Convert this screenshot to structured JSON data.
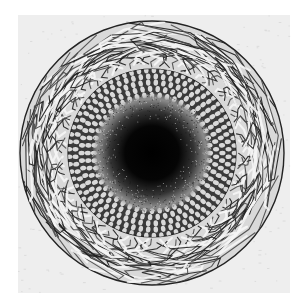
{
  "image": {
    "subject": "circular engraving: flame-ringed disc with cellular middle band and dark stippled core",
    "style": "monochrome engraving",
    "colors": {
      "background": "#ffffff",
      "paper": "#eeeeee",
      "ink": "#1a1a1a",
      "ink_mid": "#555555",
      "core": "#000000"
    },
    "layers": [
      "outer-flame-ring",
      "cellular-ring",
      "stippled-core"
    ]
  }
}
